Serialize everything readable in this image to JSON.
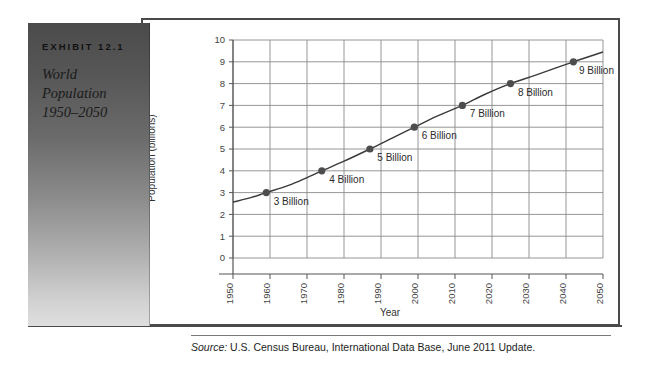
{
  "exhibit": {
    "number": "EXHIBIT 12.1",
    "title_lines": [
      "World",
      "Population",
      "1950–2050"
    ]
  },
  "source": {
    "label": "Source:",
    "text": " U.S. Census Bureau, International Data Base, June 2011 Update."
  },
  "colors": {
    "frame_border": "#4a4a4a",
    "grid": "#8a8a8a",
    "axis": "#555555",
    "line": "#3a3a3a",
    "marker": "#4d4d4d",
    "panel_dark": "#4b4b4b",
    "panel_light": "#dedede"
  },
  "chart_data": {
    "type": "line",
    "title": "World Population 1950–2050",
    "xlabel": "Year",
    "ylabel": "Population (billions)",
    "xlim": [
      1950,
      2050
    ],
    "ylim": [
      0,
      10
    ],
    "grid": true,
    "legend": "none",
    "xticks": [
      1950,
      1960,
      1970,
      1980,
      1990,
      2000,
      2010,
      2020,
      2030,
      2040,
      2050
    ],
    "xtick_labels": [
      "1950",
      "1960",
      "1970",
      "1980",
      "1990",
      "2000",
      "2010",
      "2020",
      "2030",
      "2040",
      "2050"
    ],
    "yticks": [
      0,
      1,
      2,
      3,
      4,
      5,
      6,
      7,
      8,
      9,
      10
    ],
    "ytick_labels": [
      "0",
      "1",
      "2",
      "3",
      "4",
      "5",
      "6",
      "7",
      "8",
      "9",
      "10"
    ],
    "x": [
      1950,
      1955,
      1959,
      1965,
      1970,
      1974,
      1980,
      1987,
      1993,
      1999,
      2005,
      2012,
      2018,
      2025,
      2032,
      2042,
      2050
    ],
    "y": [
      2.56,
      2.78,
      3.0,
      3.33,
      3.69,
      4.0,
      4.44,
      5.0,
      5.5,
      6.0,
      6.5,
      7.0,
      7.5,
      8.0,
      8.4,
      9.0,
      9.45
    ],
    "markers": [
      {
        "x": 1959,
        "y": 3,
        "label": "3 Billion"
      },
      {
        "x": 1974,
        "y": 4,
        "label": "4 Billion"
      },
      {
        "x": 1987,
        "y": 5,
        "label": "5 Billion"
      },
      {
        "x": 1999,
        "y": 6,
        "label": "6 Billion"
      },
      {
        "x": 2012,
        "y": 7,
        "label": "7 Billion"
      },
      {
        "x": 2025,
        "y": 8,
        "label": "8 Billion"
      },
      {
        "x": 2042,
        "y": 9,
        "label": "9 Billion"
      }
    ],
    "annotations": [
      {
        "text": "3 Billion",
        "x": 1961,
        "y": 2.45
      },
      {
        "text": "4 Billion",
        "x": 1976,
        "y": 3.45
      },
      {
        "text": "5 Billion",
        "x": 1989,
        "y": 4.45
      },
      {
        "text": "6 Billion",
        "x": 2001,
        "y": 5.45
      },
      {
        "text": "7 Billion",
        "x": 2014,
        "y": 6.45
      },
      {
        "text": "8 Billion",
        "x": 2027,
        "y": 7.45
      },
      {
        "text": "9 Billion",
        "x": 2043.5,
        "y": 8.45
      }
    ]
  }
}
